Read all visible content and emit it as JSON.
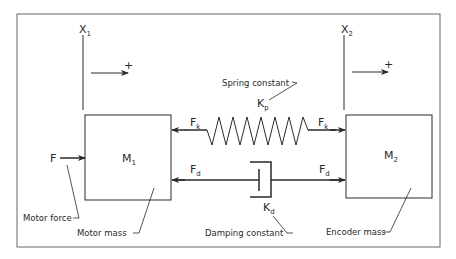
{
  "diagram": {
    "type": "two-mass spring-damper system",
    "colors": {
      "stroke": "#2a2a2a",
      "frame": "#666666",
      "background": "#ffffff"
    },
    "positions": {
      "x1": {
        "symbol": "X",
        "subscript": "1"
      },
      "x2": {
        "symbol": "X",
        "subscript": "2"
      },
      "direction_positive": "+"
    },
    "masses": {
      "m1": {
        "symbol": "M",
        "subscript": "1",
        "label": "Motor mass"
      },
      "m2": {
        "symbol": "M",
        "subscript": "2",
        "label": "Encoder mass"
      }
    },
    "forces": {
      "motor": {
        "symbol": "F",
        "label": "Motor force"
      },
      "spring_left": {
        "symbol": "F",
        "subscript": "k"
      },
      "spring_right": {
        "symbol": "F",
        "subscript": "k"
      },
      "damper_left": {
        "symbol": "F",
        "subscript": "d"
      },
      "damper_right": {
        "symbol": "F",
        "subscript": "d"
      }
    },
    "spring": {
      "symbol": "K",
      "subscript": "p",
      "label": "Spring constant"
    },
    "damper": {
      "symbol": "K",
      "subscript": "d",
      "label": "Damping constant"
    }
  }
}
